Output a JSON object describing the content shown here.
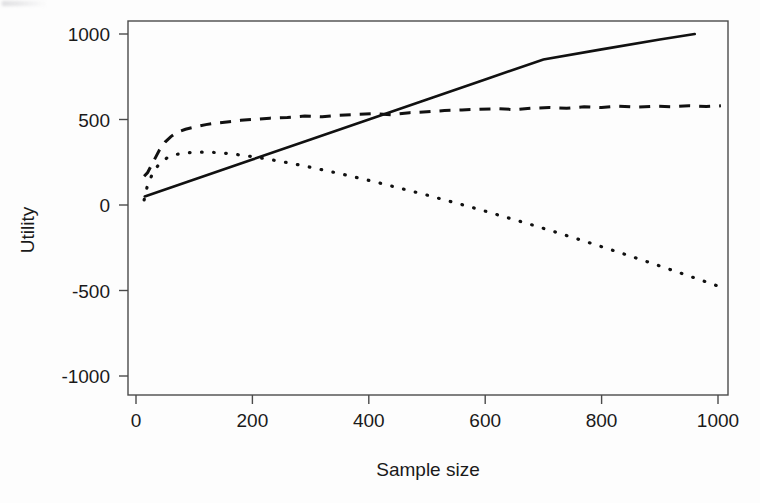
{
  "chart_data": {
    "type": "line",
    "title": "",
    "xlabel": "Sample size",
    "ylabel": "Utility",
    "xlim": [
      0,
      1030
    ],
    "ylim": [
      -1100,
      1100
    ],
    "xticks": [
      0,
      200,
      400,
      600,
      800,
      1000
    ],
    "xtick_labels": [
      "0",
      "200",
      "400",
      "600",
      "800",
      "1000"
    ],
    "yticks": [
      -1000,
      -500,
      0,
      500,
      1000
    ],
    "ytick_labels": [
      "-1000",
      "-500",
      "0",
      "500",
      "1000"
    ],
    "grid": false,
    "legend": "none",
    "box": true,
    "series": [
      {
        "name": "linear-utility",
        "style": "solid",
        "x": [
          15,
          100,
          200,
          300,
          400,
          500,
          600,
          700,
          800,
          900,
          960
        ],
        "values": [
          50,
          149,
          266,
          383,
          500,
          617,
          734,
          851,
          910,
          968,
          1000
        ]
      },
      {
        "name": "plateau-utility",
        "style": "dashed",
        "x": [
          14,
          20,
          30,
          40,
          50,
          60,
          70,
          85,
          100,
          120,
          140,
          160,
          180,
          200,
          230,
          260,
          290,
          320,
          350,
          380,
          410,
          440,
          470,
          500,
          530,
          560,
          590,
          620,
          650,
          680,
          710,
          740,
          770,
          800,
          830,
          860,
          890,
          920,
          950,
          980,
          1005
        ],
        "values": [
          168,
          190,
          255,
          320,
          368,
          400,
          424,
          443,
          455,
          470,
          480,
          487,
          495,
          500,
          508,
          512,
          520,
          516,
          525,
          530,
          534,
          528,
          540,
          545,
          552,
          556,
          560,
          563,
          558,
          566,
          570,
          566,
          574,
          570,
          578,
          572,
          578,
          575,
          580,
          576,
          580
        ]
      },
      {
        "name": "declining-utility",
        "style": "dotted",
        "x": [
          14,
          20,
          30,
          40,
          55,
          70,
          85,
          100,
          120,
          140,
          160,
          180,
          200,
          230,
          260,
          290,
          320,
          350,
          380,
          410,
          440,
          470,
          500,
          530,
          560,
          590,
          620,
          650,
          680,
          710,
          740,
          770,
          800,
          830,
          860,
          890,
          920,
          950,
          980,
          1005
        ],
        "values": [
          30,
          120,
          195,
          240,
          280,
          296,
          305,
          308,
          310,
          306,
          300,
          292,
          283,
          266,
          248,
          228,
          206,
          184,
          160,
          136,
          110,
          84,
          58,
          30,
          2,
          -26,
          -56,
          -86,
          -116,
          -147,
          -179,
          -211,
          -244,
          -277,
          -311,
          -345,
          -380,
          -415,
          -450,
          -480
        ]
      }
    ]
  },
  "axes": {
    "x_axis_name": "x-axis-sample-size",
    "y_axis_name": "y-axis-utility"
  }
}
